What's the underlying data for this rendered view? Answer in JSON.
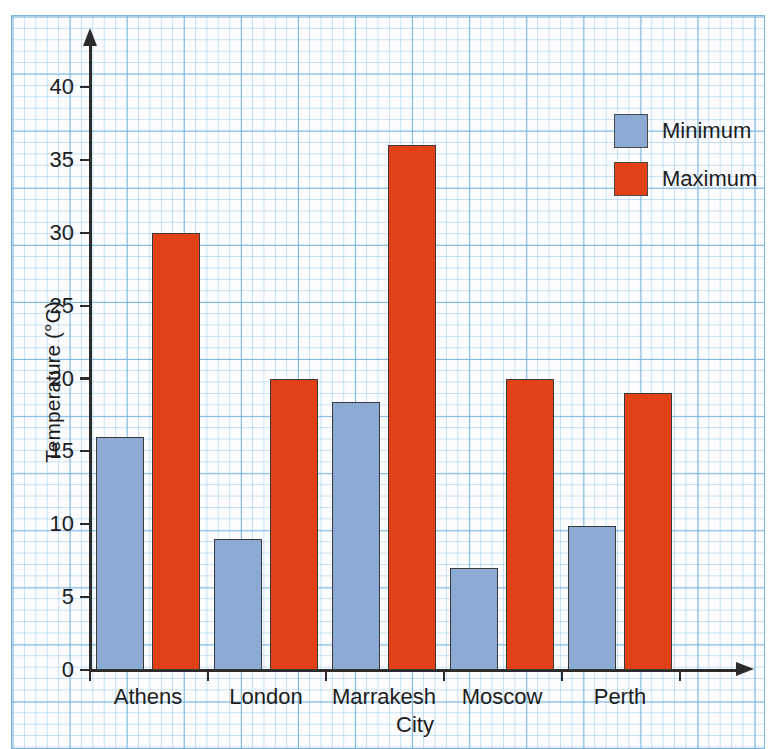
{
  "chart_data": {
    "type": "bar",
    "title": "",
    "xlabel": "City",
    "ylabel": "Temperature (°C)",
    "categories": [
      "Athens",
      "London",
      "Marrakesh",
      "Moscow",
      "Perth"
    ],
    "series": [
      {
        "name": "Minimum",
        "color": "#8cabd4",
        "values": [
          16,
          9,
          18.4,
          7,
          9.9
        ]
      },
      {
        "name": "Maximum",
        "color": "#e24118",
        "values": [
          30,
          20,
          36,
          20,
          19
        ]
      }
    ],
    "ylim": [
      0,
      40
    ],
    "ytick_labels": [
      "0",
      "5",
      "10",
      "15",
      "20",
      "25",
      "30",
      "35",
      "40"
    ],
    "ytick_values": [
      0,
      5,
      10,
      15,
      20,
      25,
      30,
      35,
      40
    ],
    "grid": true,
    "grid_color": "#8fc4e8",
    "legend_position": "top-right",
    "legend": [
      "Minimum",
      "Maximum"
    ],
    "background": "graph-paper"
  },
  "legend": {
    "items": [
      {
        "label": "Minimum",
        "color": "#8cabd4"
      },
      {
        "label": "Maximum",
        "color": "#e24118"
      }
    ]
  },
  "axes": {
    "y_title": "Temperature (°C)",
    "x_title": "City"
  }
}
